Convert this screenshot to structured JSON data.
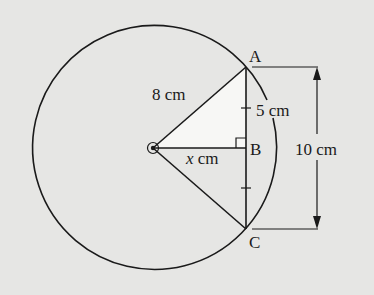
{
  "diagram": {
    "type": "circle-chord-geometry",
    "colors": {
      "background": "#e6e6e4",
      "stroke": "#1a1a1a",
      "triangle_fill": "#f7f7f5"
    },
    "points": {
      "A": "A",
      "B": "B",
      "C": "C"
    },
    "labels": {
      "radius": "8 cm",
      "half_chord": "5 cm",
      "distance_var": "x",
      "distance_unit": " cm",
      "chord_length": "10 cm"
    },
    "facts": {
      "radius_cm": 8,
      "half_chord_cm": 5,
      "chord_cm": 10,
      "right_angle_at": "B",
      "unknown": "x"
    }
  }
}
